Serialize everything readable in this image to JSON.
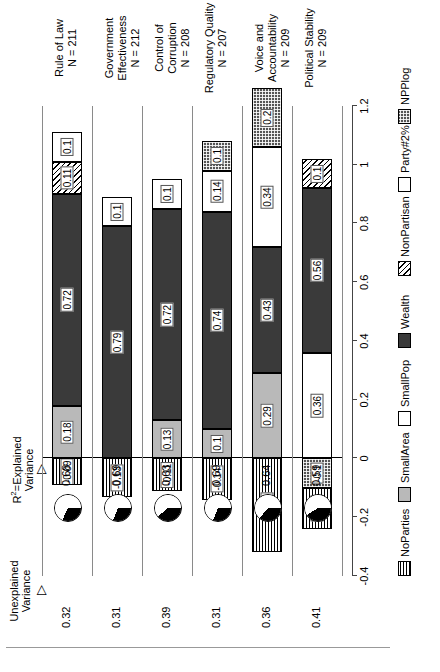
{
  "chart_data": {
    "type": "bar",
    "title": "",
    "orientation": "horizontal-stacked",
    "xlabel": "",
    "ylabel": "",
    "xlim": [
      -0.4,
      1.2
    ],
    "xticks": [
      -0.4,
      -0.2,
      0,
      0.2,
      0.4,
      0.6,
      0.8,
      1,
      1.2
    ],
    "xtick_labels": [
      "-0.4",
      "-0.2",
      "0",
      "0.2",
      "0.4",
      "0.6",
      "0.8",
      "1",
      "1.2"
    ],
    "grid": false,
    "legend_position": "bottom",
    "legend": [
      {
        "key": "NoParties",
        "label": "NoParties",
        "pattern": "horizontal-stripes"
      },
      {
        "key": "SmallArea",
        "label": "SmallArea",
        "pattern": "light-gray"
      },
      {
        "key": "SmallPop",
        "label": "SmallPop",
        "pattern": "white"
      },
      {
        "key": "Wealth",
        "label": "Wealth",
        "pattern": "dark-gray"
      },
      {
        "key": "NonPartisan",
        "label": "NonPartisan",
        "pattern": "diagonal-hatch"
      },
      {
        "key": "Party#2%",
        "label": "Party#2%",
        "pattern": "white"
      },
      {
        "key": "NPPlog",
        "label": "NPPlog",
        "pattern": "checkered"
      }
    ],
    "categories": [
      "Rule of Law",
      "Government Effectiveness",
      "Control of Corruption",
      "Regulatory Quality",
      "Voice and Accountability",
      "Political Stability"
    ],
    "category_n": [
      "N = 211",
      "N = 212",
      "N = 208",
      "N = 207",
      "N = 209",
      "N = 209"
    ],
    "rows": [
      {
        "category": "Rule of Law",
        "n": "N = 211",
        "unexplained_variance": "0.32",
        "r2": "0.68",
        "segments": [
          {
            "key": "NoParties",
            "value": -0.09,
            "label": "-0.09"
          },
          {
            "key": "SmallArea",
            "value": 0.18,
            "label": "0.18"
          },
          {
            "key": "Wealth",
            "value": 0.72,
            "label": "0.72"
          },
          {
            "key": "NonPartisan",
            "value": 0.11,
            "label": "0.11"
          },
          {
            "key": "Party#2%",
            "value": 0.1,
            "label": "0.1"
          }
        ]
      },
      {
        "category": "Government Effectiveness",
        "n": "N = 212",
        "unexplained_variance": "0.31",
        "r2": "0.69",
        "segments": [
          {
            "key": "NoParties",
            "value": -0.13,
            "label": "-0.13"
          },
          {
            "key": "Wealth",
            "value": 0.79,
            "label": "0.79"
          },
          {
            "key": "Party#2%",
            "value": 0.1,
            "label": "0.1"
          }
        ]
      },
      {
        "category": "Control of Corruption",
        "n": "N = 208",
        "unexplained_variance": "0.39",
        "r2": "0.63",
        "segments": [
          {
            "key": "NoParties",
            "value": -0.11,
            "label": "-0.11"
          },
          {
            "key": "SmallArea",
            "value": 0.13,
            "label": "0.13"
          },
          {
            "key": "Wealth",
            "value": 0.72,
            "label": "0.72"
          },
          {
            "key": "Party#2%",
            "value": 0.1,
            "label": "0.1"
          }
        ]
      },
      {
        "category": "Regulatory Quality",
        "n": "N = 207",
        "unexplained_variance": "0.31",
        "r2": "0.69",
        "segments": [
          {
            "key": "NoParties",
            "value": -0.14,
            "label": "-0.14"
          },
          {
            "key": "SmallArea",
            "value": 0.1,
            "label": "0.1"
          },
          {
            "key": "Wealth",
            "value": 0.74,
            "label": "0.74"
          },
          {
            "key": "Party#2%",
            "value": 0.14,
            "label": "0.14"
          },
          {
            "key": "NPPlog",
            "value": 0.1,
            "label": "0.1"
          }
        ]
      },
      {
        "category": "Voice and Accountability",
        "n": "N = 209",
        "unexplained_variance": "0.36",
        "r2": "0.64",
        "segments": [
          {
            "key": "NoParties",
            "value": -0.32,
            "label": "-0.32"
          },
          {
            "key": "SmallArea",
            "value": 0.29,
            "label": "0.29"
          },
          {
            "key": "Wealth",
            "value": 0.43,
            "label": "0.43"
          },
          {
            "key": "Party#2%",
            "value": 0.34,
            "label": "0.34"
          },
          {
            "key": "NPPlog",
            "value": 0.2,
            "label": "0.2"
          }
        ]
      },
      {
        "category": "Political Stability",
        "n": "N = 209",
        "unexplained_variance": "0.41",
        "r2": "0.59",
        "segments": [
          {
            "key": "NPPlog",
            "value": -0.1,
            "label": "-0.1"
          },
          {
            "key": "NoParties",
            "value": -0.14,
            "label": "-0.14"
          },
          {
            "key": "SmallPop",
            "value": 0.36,
            "label": "0.36"
          },
          {
            "key": "Wealth",
            "value": 0.56,
            "label": "0.56"
          },
          {
            "key": "NonPartisan",
            "value": 0.1,
            "label": "0.1"
          }
        ]
      }
    ],
    "annotations": {
      "unexplained_header_line1": "Unexplained",
      "unexplained_header_line2": "Variance",
      "r2_header_line1": "R",
      "r2_header_sup": "2",
      "r2_header_line1b": "=Explained",
      "r2_header_line2": "Variance",
      "arrow_glyph": "▷"
    }
  }
}
